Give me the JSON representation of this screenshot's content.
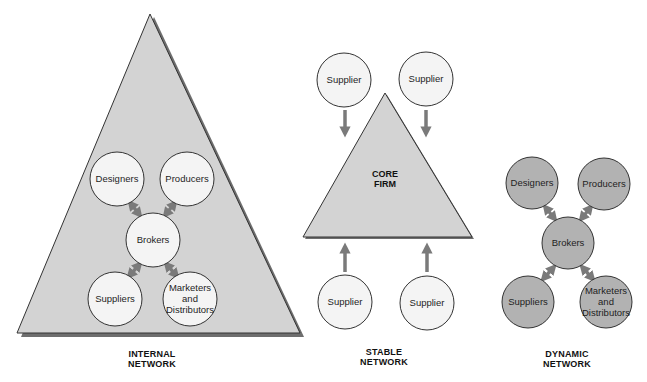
{
  "colors": {
    "triangle_fill": "#d3d3d3",
    "triangle_stroke": "#333333",
    "shadow": "#6e6e6e",
    "circle_light_fill": "#f4f4f4",
    "circle_dark_fill": "#b2b2b2",
    "circle_stroke": "#333333",
    "arrow": "#7a7a7a"
  },
  "internal_network": {
    "caption_line1": "INTERNAL",
    "caption_line2": "NETWORK",
    "nodes": {
      "designers": "Designers",
      "producers": "Producers",
      "brokers": "Brokers",
      "suppliers": "Suppliers",
      "marketers": "Marketers and Distributors"
    }
  },
  "stable_network": {
    "caption_line1": "STABLE",
    "caption_line2": "NETWORK",
    "core_line1": "CORE",
    "core_line2": "FIRM",
    "suppliers": [
      "Supplier",
      "Supplier",
      "Supplier",
      "Supplier"
    ]
  },
  "dynamic_network": {
    "caption_line1": "DYNAMIC",
    "caption_line2": "NETWORK",
    "nodes": {
      "designers": "Designers",
      "producers": "Producers",
      "brokers": "Brokers",
      "suppliers": "Suppliers",
      "marketers": "Marketers and Distributors"
    }
  }
}
